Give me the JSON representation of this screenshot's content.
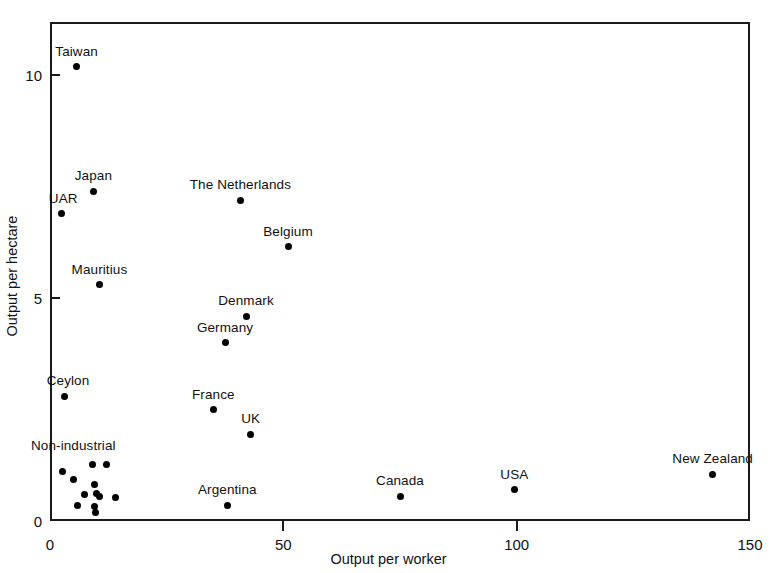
{
  "chart_data": {
    "type": "scatter",
    "title": "",
    "xlabel": "Output per worker",
    "ylabel": "Output per hectare",
    "xlim": [
      0,
      150
    ],
    "ylim": [
      0,
      11.2
    ],
    "xticks": [
      0,
      50,
      100,
      150
    ],
    "xticklabels": [
      "0",
      "50",
      "100",
      "150"
    ],
    "yticks": [
      0,
      5,
      10
    ],
    "yticklabels": [
      "0",
      "5",
      "10"
    ],
    "grid": false,
    "legend": null,
    "points": [
      {
        "label": "Taiwan",
        "x": 5.7,
        "y": 10.2,
        "label_dx": 0,
        "label_dy": -9
      },
      {
        "label": "Japan",
        "x": 9.3,
        "y": 7.4,
        "label_dx": 0,
        "label_dy": -9
      },
      {
        "label": "UAR",
        "x": 2.4,
        "y": 6.9,
        "label_dx": 2,
        "label_dy": -9
      },
      {
        "label": "The Netherlands",
        "x": 40.8,
        "y": 7.2,
        "label_dx": 0,
        "label_dy": -9
      },
      {
        "label": "Belgium",
        "x": 51.0,
        "y": 6.15,
        "label_dx": 0,
        "label_dy": -9
      },
      {
        "label": "Mauritius",
        "x": 10.6,
        "y": 5.3,
        "label_dx": 0,
        "label_dy": -9
      },
      {
        "label": "Denmark",
        "x": 42.0,
        "y": 4.6,
        "label_dx": 0,
        "label_dy": -9
      },
      {
        "label": "Germany",
        "x": 37.5,
        "y": 4.0,
        "label_dx": 0,
        "label_dy": -9
      },
      {
        "label": "Ceylon",
        "x": 3.0,
        "y": 2.8,
        "label_dx": 4,
        "label_dy": -9
      },
      {
        "label": "France",
        "x": 35.0,
        "y": 2.5,
        "label_dx": 0,
        "label_dy": -9
      },
      {
        "label": "UK",
        "x": 43.0,
        "y": 1.95,
        "label_dx": 0,
        "label_dy": -9
      },
      {
        "label": "Argentina",
        "x": 38.0,
        "y": 0.35,
        "label_dx": 0,
        "label_dy": -9
      },
      {
        "label": "Canada",
        "x": 75.0,
        "y": 0.55,
        "label_dx": 0,
        "label_dy": -9
      },
      {
        "label": "USA",
        "x": 99.5,
        "y": 0.7,
        "label_dx": 0,
        "label_dy": -9
      },
      {
        "label": "New Zealand",
        "x": 142.0,
        "y": 1.05,
        "label_dx": 0,
        "label_dy": -9
      }
    ],
    "cluster": {
      "label": "Non-industrial",
      "label_x": 5.0,
      "label_y": 1.55,
      "points": [
        {
          "x": 2.7,
          "y": 1.12
        },
        {
          "x": 9.0,
          "y": 1.27
        },
        {
          "x": 12.0,
          "y": 1.27
        },
        {
          "x": 5.0,
          "y": 0.93
        },
        {
          "x": 9.5,
          "y": 0.81
        },
        {
          "x": 7.4,
          "y": 0.6
        },
        {
          "x": 10.0,
          "y": 0.62
        },
        {
          "x": 10.6,
          "y": 0.56
        },
        {
          "x": 14.0,
          "y": 0.52
        },
        {
          "x": 5.9,
          "y": 0.34
        },
        {
          "x": 9.6,
          "y": 0.32
        },
        {
          "x": 9.8,
          "y": 0.2
        }
      ]
    }
  }
}
